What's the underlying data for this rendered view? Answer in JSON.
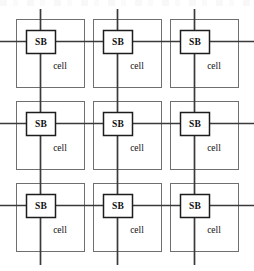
{
  "figure": {
    "type": "schematic-diagram",
    "width": 254,
    "height": 271,
    "background_color": "#ffffff"
  },
  "labels": {
    "switch_box": "SB",
    "cell": "cell"
  },
  "colors": {
    "cell_outline": "#6f6f6f",
    "switch_box_outline": "#1d1d1d",
    "wire": "#3a3a3a",
    "text": "#111111",
    "background": "#ffffff"
  },
  "grid": {
    "rows": 3,
    "columns": 3,
    "cell_count": 9,
    "cell_width": 68,
    "cell_height": 68,
    "column_x": [
      16,
      93,
      170
    ],
    "row_y": [
      19,
      101,
      183
    ],
    "column_gap": 9,
    "row_gap": 14
  },
  "switch_boxes": {
    "count": 9,
    "box_width": 29,
    "box_height": 23,
    "offset_x": 10,
    "offset_y": 11,
    "items": [
      {
        "label": "SB",
        "row": 0,
        "col": 0
      },
      {
        "label": "SB",
        "row": 0,
        "col": 1
      },
      {
        "label": "SB",
        "row": 0,
        "col": 2
      },
      {
        "label": "SB",
        "row": 1,
        "col": 0
      },
      {
        "label": "SB",
        "row": 1,
        "col": 1
      },
      {
        "label": "SB",
        "row": 1,
        "col": 2
      },
      {
        "label": "SB",
        "row": 2,
        "col": 0
      },
      {
        "label": "SB",
        "row": 2,
        "col": 1
      },
      {
        "label": "SB",
        "row": 2,
        "col": 2
      }
    ]
  },
  "cells": {
    "count": 9,
    "label_offset_x": 44,
    "label_offset_y": 48,
    "items": [
      {
        "label": "cell",
        "row": 0,
        "col": 0
      },
      {
        "label": "cell",
        "row": 0,
        "col": 1
      },
      {
        "label": "cell",
        "row": 0,
        "col": 2
      },
      {
        "label": "cell",
        "row": 1,
        "col": 0
      },
      {
        "label": "cell",
        "row": 1,
        "col": 1
      },
      {
        "label": "cell",
        "row": 1,
        "col": 2
      },
      {
        "label": "cell",
        "row": 2,
        "col": 0
      },
      {
        "label": "cell",
        "row": 2,
        "col": 1
      },
      {
        "label": "cell",
        "row": 2,
        "col": 2
      }
    ]
  },
  "wires": {
    "horizontal": {
      "count": 3,
      "x_start": 0,
      "x_end": 254,
      "y_positions": [
        41.5,
        123.5,
        205.5
      ]
    },
    "vertical": {
      "count": 3,
      "y_start": 9,
      "y_end": 265,
      "x_positions": [
        40.5,
        117.5,
        194.5
      ]
    }
  }
}
